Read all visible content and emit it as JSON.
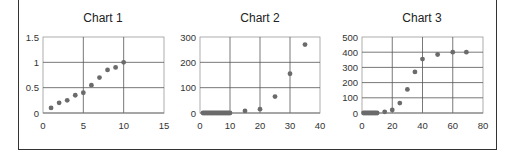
{
  "chart_data": [
    {
      "type": "scatter",
      "title": "Chart 1",
      "xlabel": "",
      "ylabel": "",
      "xlim": [
        0,
        15
      ],
      "ylim": [
        0,
        1.5
      ],
      "xticks": [
        0,
        5,
        10,
        15
      ],
      "yticks": [
        0,
        0.5,
        1,
        1.5
      ],
      "xtick_labels": [
        "0",
        "5",
        "10",
        "15"
      ],
      "ytick_labels": [
        "0",
        "0.5",
        "1",
        "1.5"
      ],
      "grid": true,
      "legend": "none",
      "x": [
        1,
        2,
        3,
        4,
        5,
        6,
        7,
        8,
        9,
        10
      ],
      "y": [
        0.1,
        0.2,
        0.25,
        0.35,
        0.4,
        0.55,
        0.7,
        0.85,
        0.9,
        1.0
      ]
    },
    {
      "type": "scatter",
      "title": "Chart 2",
      "xlabel": "",
      "ylabel": "",
      "xlim": [
        0,
        40
      ],
      "ylim": [
        0,
        300
      ],
      "xticks": [
        0,
        10,
        20,
        30,
        40
      ],
      "yticks": [
        0,
        100,
        200,
        300
      ],
      "xtick_labels": [
        "0",
        "10",
        "20",
        "30",
        "40"
      ],
      "ytick_labels": [
        "0",
        "100",
        "200",
        "300"
      ],
      "grid": true,
      "legend": "none",
      "x": [
        1,
        1.5,
        2,
        2.5,
        3,
        3.5,
        4,
        4.5,
        5,
        5.5,
        6,
        6.5,
        7,
        7.5,
        8,
        8.5,
        9,
        9.5,
        10,
        15,
        20,
        25,
        30,
        35
      ],
      "y": [
        0,
        0,
        0,
        0,
        0,
        0,
        0,
        0,
        0,
        0,
        0,
        0,
        0,
        0,
        0,
        0,
        0,
        0,
        0,
        8,
        15,
        65,
        155,
        270
      ]
    },
    {
      "type": "scatter",
      "title": "Chart 3",
      "xlabel": "",
      "ylabel": "",
      "xlim": [
        0,
        80
      ],
      "ylim": [
        0,
        500
      ],
      "xticks": [
        0,
        20,
        40,
        60,
        80
      ],
      "yticks": [
        0,
        100,
        200,
        300,
        400,
        500
      ],
      "xtick_labels": [
        "0",
        "20",
        "40",
        "60",
        "80"
      ],
      "ytick_labels": [
        "0",
        "100",
        "200",
        "300",
        "400",
        "500"
      ],
      "grid": true,
      "legend": "none",
      "x": [
        1,
        2,
        3,
        4,
        5,
        6,
        7,
        8,
        9,
        10,
        15,
        20,
        25,
        30,
        35,
        40,
        50,
        60,
        69
      ],
      "y": [
        0,
        0,
        0,
        0,
        0,
        0,
        0,
        0,
        0,
        0,
        8,
        20,
        65,
        155,
        270,
        355,
        385,
        400,
        400
      ]
    }
  ],
  "style": {
    "point_color": "#6b6b6b",
    "grid_color": "#555555",
    "frame_color": "#333333"
  }
}
